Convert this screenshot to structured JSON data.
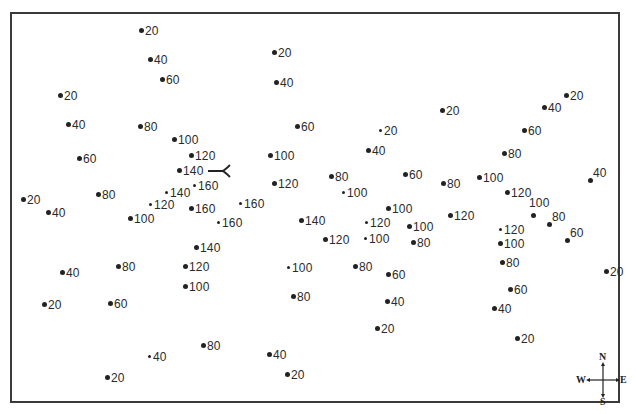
{
  "map": {
    "type": "elevation point map",
    "frame": {
      "x": 10,
      "y": 12,
      "width": 610,
      "height": 391,
      "border_color": "#3a3a3a"
    },
    "dot_color": "#222222",
    "points": [
      {
        "x": 141,
        "y": 31,
        "value": "20"
      },
      {
        "x": 150,
        "y": 60,
        "value": "40"
      },
      {
        "x": 162,
        "y": 80,
        "value": "60"
      },
      {
        "x": 60,
        "y": 96,
        "value": "20"
      },
      {
        "x": 68,
        "y": 125,
        "value": "40"
      },
      {
        "x": 140,
        "y": 127,
        "value": "80"
      },
      {
        "x": 174,
        "y": 140,
        "value": "100"
      },
      {
        "x": 79,
        "y": 159,
        "value": "60"
      },
      {
        "x": 191,
        "y": 156,
        "value": "120"
      },
      {
        "x": 179,
        "y": 171,
        "value": "140"
      },
      {
        "x": 194,
        "y": 186,
        "value": "160",
        "small": true
      },
      {
        "x": 166,
        "y": 193,
        "value": "140",
        "small": true
      },
      {
        "x": 150,
        "y": 205,
        "value": "120",
        "small": true
      },
      {
        "x": 98,
        "y": 195,
        "value": "80"
      },
      {
        "x": 23,
        "y": 200,
        "value": "20"
      },
      {
        "x": 48,
        "y": 213,
        "value": "40"
      },
      {
        "x": 130,
        "y": 219,
        "value": "100"
      },
      {
        "x": 191,
        "y": 209,
        "value": "160"
      },
      {
        "x": 240,
        "y": 204,
        "value": "160",
        "small": true
      },
      {
        "x": 218,
        "y": 223,
        "value": "160",
        "small": true
      },
      {
        "x": 196,
        "y": 248,
        "value": "140"
      },
      {
        "x": 185,
        "y": 267,
        "value": "120"
      },
      {
        "x": 185,
        "y": 287,
        "value": "100"
      },
      {
        "x": 118,
        "y": 267,
        "value": "80"
      },
      {
        "x": 62,
        "y": 273,
        "value": "40"
      },
      {
        "x": 44,
        "y": 305,
        "value": "20"
      },
      {
        "x": 110,
        "y": 304,
        "value": "60"
      },
      {
        "x": 149,
        "y": 357,
        "value": "40",
        "small": true
      },
      {
        "x": 203,
        "y": 346,
        "value": "80"
      },
      {
        "x": 107,
        "y": 378,
        "value": "20"
      },
      {
        "x": 274,
        "y": 53,
        "value": "20"
      },
      {
        "x": 276,
        "y": 83,
        "value": "40"
      },
      {
        "x": 297,
        "y": 127,
        "value": "60"
      },
      {
        "x": 270,
        "y": 156,
        "value": "100"
      },
      {
        "x": 274,
        "y": 184,
        "value": "120"
      },
      {
        "x": 301,
        "y": 221,
        "value": "140"
      },
      {
        "x": 325,
        "y": 240,
        "value": "120"
      },
      {
        "x": 288,
        "y": 268,
        "value": "100",
        "small": true
      },
      {
        "x": 293,
        "y": 297,
        "value": "80"
      },
      {
        "x": 269,
        "y": 355,
        "value": "40"
      },
      {
        "x": 287,
        "y": 375,
        "value": "20"
      },
      {
        "x": 380,
        "y": 131,
        "value": "20",
        "small": true
      },
      {
        "x": 368,
        "y": 151,
        "value": "40"
      },
      {
        "x": 331,
        "y": 177,
        "value": "80"
      },
      {
        "x": 343,
        "y": 193,
        "value": "100",
        "small": true
      },
      {
        "x": 405,
        "y": 175,
        "value": "60"
      },
      {
        "x": 442,
        "y": 111,
        "value": "20"
      },
      {
        "x": 443,
        "y": 184,
        "value": "80"
      },
      {
        "x": 388,
        "y": 209,
        "value": "100"
      },
      {
        "x": 366,
        "y": 223,
        "value": "120",
        "small": true
      },
      {
        "x": 365,
        "y": 239,
        "value": "100",
        "small": true
      },
      {
        "x": 409,
        "y": 227,
        "value": "100"
      },
      {
        "x": 413,
        "y": 243,
        "value": "80"
      },
      {
        "x": 450,
        "y": 216,
        "value": "120"
      },
      {
        "x": 355,
        "y": 267,
        "value": "80"
      },
      {
        "x": 388,
        "y": 275,
        "value": "60"
      },
      {
        "x": 387,
        "y": 302,
        "value": "40"
      },
      {
        "x": 377,
        "y": 329,
        "value": "20"
      },
      {
        "x": 566,
        "y": 96,
        "value": "20"
      },
      {
        "x": 544,
        "y": 108,
        "value": "40"
      },
      {
        "x": 524,
        "y": 131,
        "value": "60"
      },
      {
        "x": 504,
        "y": 154,
        "value": "80"
      },
      {
        "x": 479,
        "y": 178,
        "value": "100"
      },
      {
        "x": 507,
        "y": 193,
        "value": "120"
      },
      {
        "x": 590,
        "y": 181,
        "value": "40",
        "label_pos": "upright"
      },
      {
        "x": 533,
        "y": 216,
        "value": "100",
        "label_pos": "above"
      },
      {
        "x": 549,
        "y": 225,
        "value": "80",
        "label_pos": "upright"
      },
      {
        "x": 567,
        "y": 241,
        "value": "60",
        "label_pos": "upright"
      },
      {
        "x": 500,
        "y": 230,
        "value": "120",
        "small": true
      },
      {
        "x": 500,
        "y": 244,
        "value": "100"
      },
      {
        "x": 502,
        "y": 263,
        "value": "80"
      },
      {
        "x": 510,
        "y": 290,
        "value": "60"
      },
      {
        "x": 494,
        "y": 309,
        "value": "40"
      },
      {
        "x": 517,
        "y": 339,
        "value": "20"
      },
      {
        "x": 606,
        "y": 272,
        "value": "20"
      }
    ],
    "arrow_marker": {
      "x1": 208,
      "y1": 171,
      "x2": 228,
      "y2": 171,
      "symbol": "fork-arrow-pointing-west",
      "label": ""
    },
    "compass": {
      "north": "N",
      "south": "S",
      "east": "E",
      "west": "W"
    }
  }
}
